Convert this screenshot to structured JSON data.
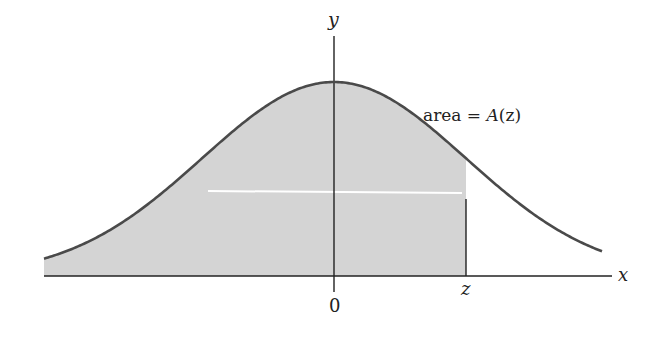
{
  "chart_data": {
    "type": "area",
    "title": "",
    "xlabel": "x",
    "ylabel": "y",
    "tick_labels": {
      "origin": "0",
      "z_marker": "z"
    },
    "annotation": "area = A(z)",
    "curve": "standard normal pdf",
    "shaded_region": {
      "from": "-infinity",
      "to": "z"
    },
    "z_value_approx": 1.0,
    "x_range_approx": [
      -2.85,
      2.6
    ],
    "grid": false,
    "legend": null
  },
  "labels": {
    "y_axis": "y",
    "x_axis": "x",
    "origin": "0",
    "z": "z",
    "area_prefix": "area = ",
    "area_func": "A",
    "area_arg": "(z)"
  },
  "colors": {
    "curve": "#4a4a4a",
    "fill": "#d4d4d4",
    "axis": "#222222",
    "highlight_line": "#ffffff"
  }
}
